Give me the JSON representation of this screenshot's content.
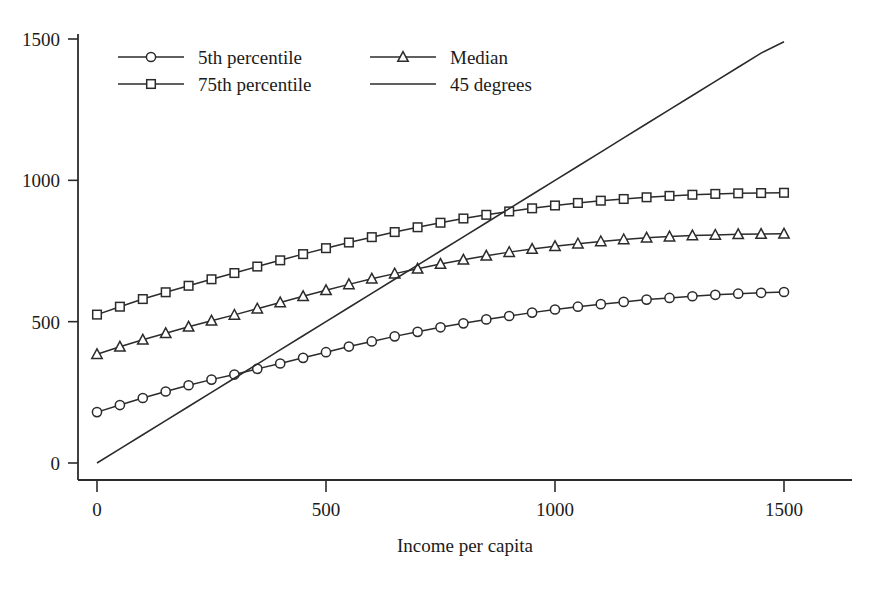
{
  "chart_data": {
    "type": "line",
    "title": "",
    "xlabel": "Income per capita",
    "ylabel": "",
    "xlim": [
      0,
      1560
    ],
    "ylim": [
      0,
      1560
    ],
    "xticks": [
      0,
      500,
      1000,
      1500
    ],
    "yticks": [
      0,
      500,
      1000,
      1500
    ],
    "xtick_labels": [
      "0",
      "500",
      "1000",
      "1500"
    ],
    "ytick_labels": [
      "0",
      "500",
      "1000",
      "1500"
    ],
    "grid": false,
    "legend_position": "upper left",
    "x": [
      0,
      50,
      100,
      150,
      200,
      250,
      300,
      350,
      400,
      450,
      500,
      550,
      600,
      650,
      700,
      750,
      800,
      850,
      900,
      950,
      1000,
      1050,
      1100,
      1150,
      1200,
      1250,
      1300,
      1350,
      1400,
      1450,
      1500
    ],
    "series": [
      {
        "name": "5th percentile",
        "marker": "circle",
        "values": [
          180,
          205,
          230,
          253,
          275,
          295,
          313,
          333,
          352,
          372,
          392,
          412,
          430,
          448,
          464,
          480,
          494,
          508,
          520,
          532,
          543,
          553,
          562,
          570,
          578,
          584,
          590,
          595,
          599,
          602,
          605
        ]
      },
      {
        "name": "Median",
        "marker": "triangle",
        "values": [
          385,
          411,
          436,
          459,
          482,
          503,
          524,
          546,
          568,
          590,
          611,
          632,
          652,
          670,
          687,
          704,
          719,
          733,
          746,
          757,
          767,
          776,
          784,
          791,
          797,
          801,
          805,
          807,
          809,
          810,
          811
        ]
      },
      {
        "name": "75th percentile",
        "marker": "square",
        "values": [
          525,
          553,
          580,
          604,
          627,
          650,
          672,
          695,
          717,
          739,
          760,
          780,
          799,
          817,
          834,
          850,
          865,
          878,
          890,
          901,
          911,
          920,
          928,
          934,
          940,
          945,
          949,
          952,
          954,
          955,
          956
        ]
      },
      {
        "name": "45 degrees",
        "marker": "none",
        "values": [
          0,
          50,
          100,
          150,
          200,
          250,
          300,
          350,
          400,
          450,
          500,
          550,
          600,
          650,
          700,
          750,
          800,
          850,
          900,
          950,
          1000,
          1050,
          1100,
          1150,
          1200,
          1250,
          1300,
          1350,
          1400,
          1450,
          1490
        ]
      }
    ],
    "legend": [
      {
        "label": "5th percentile",
        "marker": "circle"
      },
      {
        "label": "Median",
        "marker": "triangle"
      },
      {
        "label": "75th percentile",
        "marker": "square"
      },
      {
        "label": "45 degrees",
        "marker": "none"
      }
    ]
  }
}
